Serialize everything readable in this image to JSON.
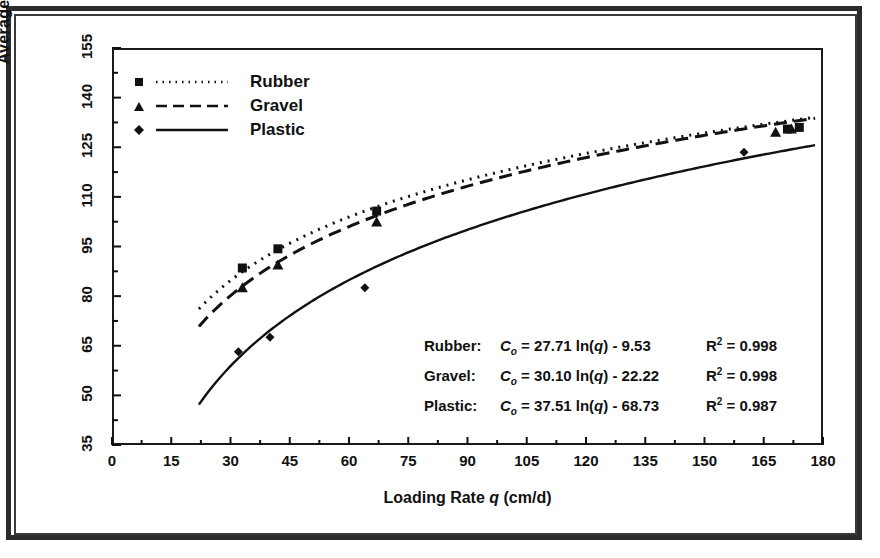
{
  "chart_data": {
    "type": "scatter",
    "title": "",
    "xlabel": "Loading Rate q  (cm/d)",
    "ylabel": "Average C_o  (mg/l)",
    "xlim": [
      0,
      180
    ],
    "ylim": [
      35,
      155
    ],
    "xticks": [
      0,
      15,
      30,
      45,
      60,
      75,
      90,
      105,
      120,
      135,
      150,
      165,
      180
    ],
    "yticks": [
      35,
      50,
      65,
      80,
      95,
      110,
      125,
      140,
      155
    ],
    "minor_ticks": true,
    "grid": false,
    "legend_position": "top-left",
    "series": [
      {
        "name": "Rubber",
        "marker": "square",
        "line": "dotted",
        "equation": "C_o = 27.71 ln(q) - 9.53",
        "slope": 27.71,
        "intercept": -9.53,
        "r2": 0.998,
        "points": [
          {
            "x": 33,
            "y": 88.5
          },
          {
            "x": 42,
            "y": 94.3
          },
          {
            "x": 67,
            "y": 105.7
          },
          {
            "x": 171,
            "y": 130.5
          },
          {
            "x": 174,
            "y": 131.0
          }
        ]
      },
      {
        "name": "Gravel",
        "marker": "triangle",
        "line": "dashed",
        "equation": "C_o = 30.10 ln(q) - 22.22",
        "slope": 30.1,
        "intercept": -22.22,
        "r2": 0.998,
        "points": [
          {
            "x": 33,
            "y": 82.5
          },
          {
            "x": 42,
            "y": 89.4
          },
          {
            "x": 67,
            "y": 102.4
          },
          {
            "x": 168,
            "y": 129.5
          },
          {
            "x": 172,
            "y": 130.5
          }
        ]
      },
      {
        "name": "Plastic",
        "marker": "diamond",
        "line": "solid",
        "equation": "C_o = 37.51 ln(q) - 68.73",
        "slope": 37.51,
        "intercept": -68.73,
        "r2": 0.987,
        "points": [
          {
            "x": 32,
            "y": 63.2
          },
          {
            "x": 40,
            "y": 67.6
          },
          {
            "x": 64,
            "y": 82.5
          },
          {
            "x": 160,
            "y": 123.5
          }
        ]
      }
    ],
    "curve_x_range": [
      22,
      178
    ]
  },
  "legend": {
    "items": [
      {
        "label": "Rubber",
        "marker": "square-marker",
        "line": "dotted-line-swatch"
      },
      {
        "label": "Gravel",
        "marker": "triangle-marker",
        "line": "dashed-line-swatch"
      },
      {
        "label": "Plastic",
        "marker": "diamond-marker",
        "line": "solid-line-swatch"
      }
    ]
  },
  "equations": [
    {
      "name": "Rubber:",
      "lhs": "C",
      "lhs_sub": "o",
      "rhs": " = 27.71 ln(",
      "var": "q",
      "rhs_tail": ") - 9.53",
      "r_label": "R",
      "r_sup": "2",
      "r_value": " = 0.998"
    },
    {
      "name": "Gravel:",
      "lhs": "C",
      "lhs_sub": "o",
      "rhs": " = 30.10 ln(",
      "var": "q",
      "rhs_tail": ") - 22.22",
      "r_label": "R",
      "r_sup": "2",
      "r_value": " = 0.998"
    },
    {
      "name": "Plastic:",
      "lhs": "C",
      "lhs_sub": "o",
      "rhs": " = 37.51 ln(",
      "var": "q",
      "rhs_tail": ") - 68.73",
      "r_label": "R",
      "r_sup": "2",
      "r_value": " = 0.987"
    }
  ],
  "axes": {
    "y_title_main": "Average ",
    "y_title_var": "C",
    "y_title_sub": "o",
    "y_title_units": "  (mg/l)",
    "x_title_main": "Loading Rate ",
    "x_title_var": "q",
    "x_title_units": "  (cm/d)"
  },
  "colors": {
    "ink": "#111111",
    "frame": "#2b2b2b",
    "background": "#ffffff"
  }
}
